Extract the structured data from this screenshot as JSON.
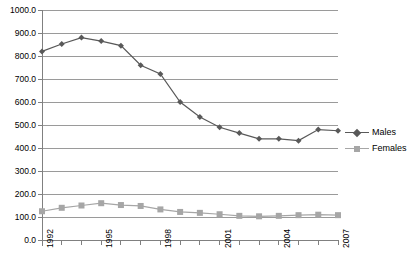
{
  "chart_data": {
    "type": "line",
    "title": "",
    "subtitle": "",
    "xlabel": "",
    "ylabel": "",
    "x": [
      1992,
      1993,
      1994,
      1995,
      1996,
      1997,
      1998,
      1999,
      2000,
      2001,
      2002,
      2003,
      2004,
      2005,
      2006,
      2007
    ],
    "categories": [
      "1992",
      "1993",
      "1994",
      "1995",
      "1996",
      "1997",
      "1998",
      "1999",
      "2000",
      "2001",
      "2002",
      "2003",
      "2004",
      "2005",
      "2006",
      "2007"
    ],
    "series": [
      {
        "name": "Males",
        "color": "#595959",
        "marker": "diamond",
        "values": [
          820,
          852,
          880,
          865,
          845,
          760,
          722,
          600,
          535,
          490,
          465,
          440,
          440,
          432,
          480,
          475
        ]
      },
      {
        "name": "Females",
        "color": "#a6a6a6",
        "marker": "square",
        "values": [
          125,
          140,
          150,
          160,
          152,
          148,
          133,
          122,
          118,
          112,
          105,
          103,
          105,
          108,
          110,
          108
        ]
      }
    ],
    "ylim": [
      0,
      1000
    ],
    "ytick_step": 100,
    "ytick_labels": [
      "0.0",
      "100.0",
      "200.0",
      "300.0",
      "400.0",
      "500.0",
      "600.0",
      "700.0",
      "800.0",
      "900.0",
      "1000.0"
    ],
    "xtick_labels_shown": [
      "1992",
      "1995",
      "1998",
      "2001",
      "2004",
      "2007"
    ],
    "grid": true,
    "grid_axis": "y",
    "legend_position": "right"
  },
  "legend": {
    "entries": [
      {
        "label": "Males"
      },
      {
        "label": "Females"
      }
    ]
  },
  "colors": {
    "males": "#595959",
    "females": "#a6a6a6",
    "grid": "#9a9a9a",
    "axis": "#808080",
    "background": "#ffffff"
  }
}
